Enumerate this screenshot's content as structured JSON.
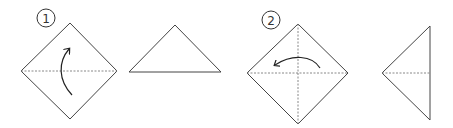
{
  "diagram": {
    "type": "origami-instructions",
    "steps": [
      {
        "number": "1",
        "fold_direction": "up",
        "crease": "horizontal",
        "result": "triangle-pointing-up"
      },
      {
        "number": "2",
        "fold_direction": "left",
        "crease": "horizontal-and-vertical",
        "result": "triangle-pointing-left"
      }
    ],
    "colors": {
      "line": "#444444",
      "crease": "#888888",
      "background": "#ffffff"
    }
  }
}
